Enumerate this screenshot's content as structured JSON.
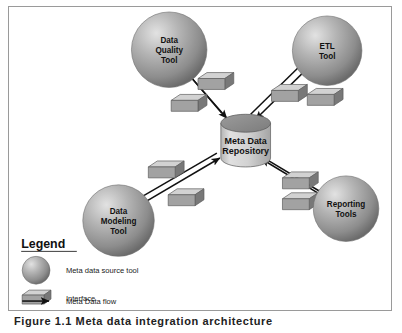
{
  "figure": {
    "caption": "Figure 1.1  Meta data integration architecture"
  },
  "colors": {
    "sphere_light": "#d6d6d6",
    "sphere_mid": "#9e9e9e",
    "sphere_dark": "#6f6f6f",
    "box_top": "#d2d2d2",
    "box_front": "#9c9c9c",
    "box_side": "#787878",
    "cylinder_top": "#8f8f8f",
    "cylinder_body": "#cfcfcf",
    "arrow": "#111111",
    "border": "#9a9a9a",
    "background": "#ffffff"
  },
  "nodes": {
    "repository": {
      "name": "meta-data-repository",
      "line1": "Meta Data",
      "line2": "Repository"
    },
    "data_quality_tool": {
      "name": "data-quality-tool",
      "line1": "Data",
      "line2": "Quality",
      "line3": "Tool"
    },
    "etl_tool": {
      "name": "etl-tool",
      "line1": "ETL",
      "line2": "Tool",
      "line3": ""
    },
    "data_modeling_tool": {
      "name": "data-modeling-tool",
      "line1": "Data",
      "line2": "Modeling",
      "line3": "Tool"
    },
    "reporting_tools": {
      "name": "reporting-tools",
      "line1": "Reporting",
      "line2": "Tools",
      "line3": ""
    }
  },
  "legend": {
    "heading": "Legend",
    "items": [
      {
        "icon": "sphere-icon",
        "label": "Meta data source tool"
      },
      {
        "icon": "interface-box-icon",
        "label": "Interface"
      },
      {
        "icon": "arrow-icon",
        "label": "Meta Data flow"
      }
    ]
  }
}
